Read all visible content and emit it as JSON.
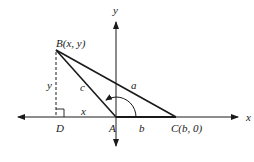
{
  "diagram": {
    "title": "",
    "axes": {
      "x_label": "x",
      "y_label": "y"
    },
    "points": {
      "B": {
        "label": "B(x, y)",
        "x": 56,
        "y": 50
      },
      "D": {
        "label": "D",
        "x": 56,
        "y": 117
      },
      "A": {
        "label": "A",
        "x": 116,
        "y": 117
      },
      "C": {
        "label": "C(b, 0)",
        "x": 176,
        "y": 117
      }
    },
    "sides": {
      "a": "a",
      "b": "b",
      "c": "c",
      "x": "x",
      "y": "y"
    },
    "colors": {
      "stroke": "#1a1a1a",
      "background": "#ffffff"
    }
  }
}
